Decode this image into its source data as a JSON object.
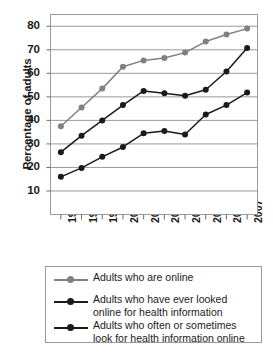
{
  "chart_data": {
    "type": "line",
    "title": "",
    "xlabel": "",
    "ylabel": "Percentage of adults",
    "categories": [
      "1998",
      "1999",
      "1900",
      "2001",
      "2002",
      "2003",
      "2004",
      "2005",
      "2006",
      "2007"
    ],
    "ylim": [
      0,
      85
    ],
    "yticks": [
      10,
      20,
      30,
      40,
      50,
      60,
      70,
      80
    ],
    "ytick_labels": [
      "10",
      "20",
      "30",
      "40",
      "50",
      "60",
      "70",
      "80"
    ],
    "grid": true,
    "legend_position": "bottom",
    "series": [
      {
        "name": "Adults who are online",
        "color": "#808080",
        "values": [
          37.5,
          45.5,
          53.5,
          62.8,
          65.5,
          66.5,
          68.8,
          73.5,
          76.5,
          79.0
        ]
      },
      {
        "name": "Adults who have ever looked online for health information",
        "color": "#1a1a1a",
        "values": [
          26.5,
          33.5,
          40.0,
          46.5,
          52.5,
          51.5,
          50.5,
          53.0,
          60.8,
          70.8
        ]
      },
      {
        "name": "Adults who often or sometimes look for health information online",
        "color": "#1a1a1a",
        "values": [
          16.0,
          19.8,
          24.5,
          28.7,
          34.5,
          35.5,
          34.0,
          42.5,
          46.5,
          51.8
        ]
      }
    ]
  },
  "legend": {
    "entries": [
      {
        "lines": [
          "Adults who are online"
        ]
      },
      {
        "lines": [
          "Adults who have ever looked",
          "online for health information"
        ]
      },
      {
        "lines": [
          "Adults who often or sometimes",
          "look for health information online"
        ]
      }
    ]
  }
}
